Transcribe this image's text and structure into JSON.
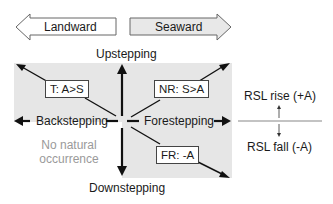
{
  "header_arrows": {
    "landward": "Landward",
    "seaward": "Seaward"
  },
  "axes": {
    "up": "Upstepping",
    "down": "Downstepping",
    "left": "Backstepping",
    "right": "Forestepping"
  },
  "quadrants": {
    "transgression": "T: A>S",
    "normal_regression": "NR: S>A",
    "forced_regression": "FR: -A",
    "no_occurrence_line1": "No natural",
    "no_occurrence_line2": "occurrence"
  },
  "legend": {
    "rise": "RSL rise (+A)",
    "fall": "RSL fall (-A)"
  },
  "colors": {
    "shade": "#e6e6e6",
    "seaward_fill": "#e8e8e8",
    "line": "#111111",
    "muted_text": "#9a9a9a"
  }
}
